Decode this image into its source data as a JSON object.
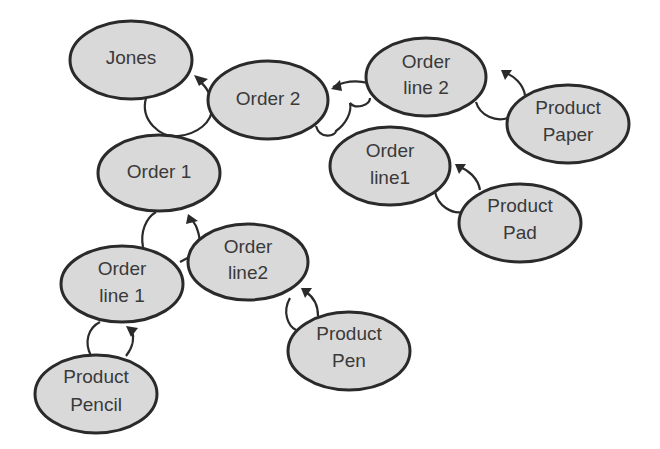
{
  "diagram": {
    "type": "object-reference-tree",
    "colors": {
      "node_fill": "#d9d9d9",
      "node_stroke": "#2a2a2a",
      "text": "#3a3a3a",
      "background": "#ffffff"
    },
    "nodes": [
      {
        "id": "jones",
        "lines": [
          "Jones"
        ],
        "cx": 131,
        "cy": 60,
        "rx": 61,
        "ry": 39
      },
      {
        "id": "order2",
        "lines": [
          "Order 2"
        ],
        "cx": 268,
        "cy": 100,
        "rx": 60,
        "ry": 39
      },
      {
        "id": "order1",
        "lines": [
          "Order 1"
        ],
        "cx": 159,
        "cy": 173,
        "rx": 61,
        "ry": 38
      },
      {
        "id": "o2_line2",
        "lines": [
          "Order",
          "line 2"
        ],
        "cx": 426,
        "cy": 77,
        "rx": 60,
        "ry": 39
      },
      {
        "id": "product_paper",
        "lines": [
          "Product",
          "Paper"
        ],
        "cx": 568,
        "cy": 124,
        "rx": 61,
        "ry": 39
      },
      {
        "id": "o2_line1",
        "lines": [
          "Order",
          "line1"
        ],
        "cx": 390,
        "cy": 166,
        "rx": 60,
        "ry": 39
      },
      {
        "id": "product_pad",
        "lines": [
          "Product",
          "Pad"
        ],
        "cx": 520,
        "cy": 223,
        "rx": 61,
        "ry": 39
      },
      {
        "id": "o1_line2",
        "lines": [
          "Order",
          "line2"
        ],
        "cx": 248,
        "cy": 262,
        "rx": 60,
        "ry": 38
      },
      {
        "id": "o1_line1",
        "lines": [
          "Order",
          "line 1"
        ],
        "cx": 122,
        "cy": 284,
        "rx": 61,
        "ry": 38
      },
      {
        "id": "product_pen",
        "lines": [
          "Product",
          "Pen"
        ],
        "cx": 349,
        "cy": 351,
        "rx": 61,
        "ry": 39
      },
      {
        "id": "product_pencil",
        "lines": [
          "Product",
          "Pencil"
        ],
        "cx": 96,
        "cy": 394,
        "rx": 61,
        "ry": 39
      }
    ],
    "edges": [
      {
        "from": "order2",
        "to": "jones"
      },
      {
        "from": "order1",
        "to": "jones"
      },
      {
        "from": "o2_line2",
        "to": "order2"
      },
      {
        "from": "o2_line1",
        "to": "order2"
      },
      {
        "from": "product_paper",
        "to": "o2_line2"
      },
      {
        "from": "product_pad",
        "to": "o2_line1"
      },
      {
        "from": "o1_line2",
        "to": "order1"
      },
      {
        "from": "o1_line1",
        "to": "order1"
      },
      {
        "from": "product_pen",
        "to": "o1_line2"
      },
      {
        "from": "product_pencil",
        "to": "o1_line1"
      }
    ]
  },
  "labels": {
    "jones": [
      "Jones"
    ],
    "order2": [
      "Order 2"
    ],
    "order1": [
      "Order 1"
    ],
    "o2_line2": [
      "Order",
      "line 2"
    ],
    "product_paper": [
      "Product",
      "Paper"
    ],
    "o2_line1": [
      "Order",
      "line1"
    ],
    "product_pad": [
      "Product",
      "Pad"
    ],
    "o1_line2": [
      "Order",
      "line2"
    ],
    "o1_line1": [
      "Order",
      "line 1"
    ],
    "product_pen": [
      "Product",
      "Pen"
    ],
    "product_pencil": [
      "Product",
      "Pencil"
    ]
  }
}
